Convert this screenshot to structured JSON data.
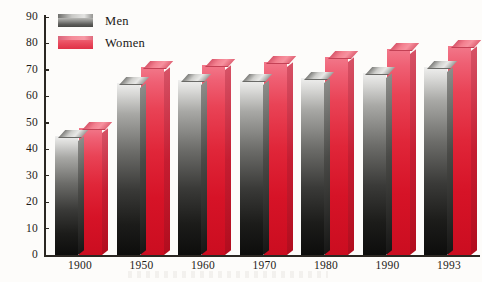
{
  "chart_data": {
    "type": "bar",
    "title": "",
    "xlabel": "",
    "ylabel": "",
    "categories": [
      "1900",
      "1950",
      "1960",
      "1970",
      "1980",
      "1990",
      "1993"
    ],
    "series": [
      {
        "name": "Men",
        "color": "#7a7a77",
        "values": [
          45,
          65,
          66,
          66,
          67,
          69,
          71
        ]
      },
      {
        "name": "Women",
        "color": "#e23b4e",
        "values": [
          48,
          71,
          72,
          73,
          75,
          78,
          79
        ]
      }
    ],
    "ylim": [
      0,
      90
    ],
    "ytick_step": 10,
    "yticks": [
      "0",
      "10",
      "20",
      "30",
      "40",
      "50",
      "60",
      "70",
      "80",
      "90"
    ],
    "grid": false,
    "legend_position": "top-left",
    "style": "3d-gradient-columns"
  },
  "legend": {
    "items": [
      {
        "label": "Men",
        "swatch": "men-swatch"
      },
      {
        "label": "Women",
        "swatch": "women-swatch"
      }
    ]
  },
  "axes": {
    "y_axis_name": "y-axis",
    "x_axis_name": "x-axis"
  }
}
